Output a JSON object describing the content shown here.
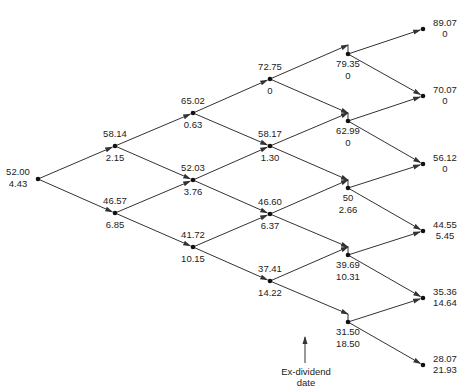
{
  "diagram": {
    "type": "binomial-tree",
    "colors": {
      "line": "#333333",
      "text": "#222222",
      "background": "#ffffff"
    },
    "annotation": {
      "line1": "Ex-dividend",
      "line2": "date"
    },
    "nodes": [
      {
        "id": "n0_0",
        "col": 0,
        "x": 38,
        "y": 179,
        "price": "52.00",
        "value": "4.43",
        "label_pos": "left"
      },
      {
        "id": "n1_0",
        "col": 1,
        "x": 115,
        "y": 146,
        "price": "58.14",
        "value": "2.15",
        "label_pos": "around"
      },
      {
        "id": "n1_1",
        "col": 1,
        "x": 115,
        "y": 213,
        "price": "46.57",
        "value": "6.85",
        "label_pos": "around"
      },
      {
        "id": "n2_0",
        "col": 2,
        "x": 193,
        "y": 113,
        "price": "65.02",
        "value": "0.63",
        "label_pos": "around"
      },
      {
        "id": "n2_1",
        "col": 2,
        "x": 193,
        "y": 180,
        "price": "52.03",
        "value": "3.76",
        "label_pos": "around"
      },
      {
        "id": "n2_2",
        "col": 2,
        "x": 193,
        "y": 247,
        "price": "41.72",
        "value": "10.15",
        "label_pos": "around"
      },
      {
        "id": "n3_0",
        "col": 3,
        "x": 270,
        "y": 79,
        "price": "72.75",
        "value": "0",
        "label_pos": "around"
      },
      {
        "id": "n3_1",
        "col": 3,
        "x": 270,
        "y": 146,
        "price": "58.17",
        "value": "1.30",
        "label_pos": "around"
      },
      {
        "id": "n3_2",
        "col": 3,
        "x": 270,
        "y": 214,
        "price": "46.60",
        "value": "6.37",
        "label_pos": "around"
      },
      {
        "id": "n3_3",
        "col": 3,
        "x": 270,
        "y": 281,
        "price": "37.41",
        "value": "14.22",
        "label_pos": "around"
      },
      {
        "id": "n4_0",
        "col": 4,
        "x": 348,
        "y": 54,
        "pre_y": 45,
        "price": "79.35",
        "value": "0",
        "label_pos": "below"
      },
      {
        "id": "n4_1",
        "col": 4,
        "x": 348,
        "y": 121,
        "pre_y": 113,
        "price": "62.99",
        "value": "0",
        "label_pos": "below"
      },
      {
        "id": "n4_2",
        "col": 4,
        "x": 348,
        "y": 188,
        "pre_y": 180,
        "price": "50",
        "value": "2.66",
        "label_pos": "below"
      },
      {
        "id": "n4_3",
        "col": 4,
        "x": 348,
        "y": 255,
        "pre_y": 247,
        "price": "39.69",
        "value": "10.31",
        "label_pos": "below"
      },
      {
        "id": "n4_4",
        "col": 4,
        "x": 348,
        "y": 322,
        "pre_y": 314,
        "price": "31.50",
        "value": "18.50",
        "label_pos": "below"
      },
      {
        "id": "n5_0",
        "col": 5,
        "x": 423,
        "y": 29,
        "price": "89.07",
        "value": "0",
        "label_pos": "right"
      },
      {
        "id": "n5_1",
        "col": 5,
        "x": 423,
        "y": 96,
        "price": "70.07",
        "value": "0",
        "label_pos": "right"
      },
      {
        "id": "n5_2",
        "col": 5,
        "x": 423,
        "y": 164,
        "price": "56.12",
        "value": "0",
        "label_pos": "right"
      },
      {
        "id": "n5_3",
        "col": 5,
        "x": 423,
        "y": 231,
        "price": "44.55",
        "value": "5.45",
        "label_pos": "right"
      },
      {
        "id": "n5_4",
        "col": 5,
        "x": 423,
        "y": 298,
        "price": "35.36",
        "value": "14.64",
        "label_pos": "right"
      },
      {
        "id": "n5_5",
        "col": 5,
        "x": 423,
        "y": 365,
        "price": "28.07",
        "value": "21.93",
        "label_pos": "right"
      }
    ],
    "edges": [
      [
        "n0_0",
        "n1_0"
      ],
      [
        "n0_0",
        "n1_1"
      ],
      [
        "n1_0",
        "n2_0"
      ],
      [
        "n1_0",
        "n2_1"
      ],
      [
        "n1_1",
        "n2_1"
      ],
      [
        "n1_1",
        "n2_2"
      ],
      [
        "n2_0",
        "n3_0"
      ],
      [
        "n2_0",
        "n3_1"
      ],
      [
        "n2_1",
        "n3_1"
      ],
      [
        "n2_1",
        "n3_2"
      ],
      [
        "n2_2",
        "n3_2"
      ],
      [
        "n2_2",
        "n3_3"
      ],
      [
        "n3_0",
        "n4_0"
      ],
      [
        "n3_0",
        "n4_1"
      ],
      [
        "n3_1",
        "n4_1"
      ],
      [
        "n3_1",
        "n4_2"
      ],
      [
        "n3_2",
        "n4_2"
      ],
      [
        "n3_2",
        "n4_3"
      ],
      [
        "n3_3",
        "n4_3"
      ],
      [
        "n3_3",
        "n4_4"
      ],
      [
        "n4_0",
        "n5_0"
      ],
      [
        "n4_0",
        "n5_1"
      ],
      [
        "n4_1",
        "n5_1"
      ],
      [
        "n4_1",
        "n5_2"
      ],
      [
        "n4_2",
        "n5_2"
      ],
      [
        "n4_2",
        "n5_3"
      ],
      [
        "n4_3",
        "n5_3"
      ],
      [
        "n4_3",
        "n5_4"
      ],
      [
        "n4_4",
        "n5_4"
      ],
      [
        "n4_4",
        "n5_5"
      ]
    ]
  }
}
